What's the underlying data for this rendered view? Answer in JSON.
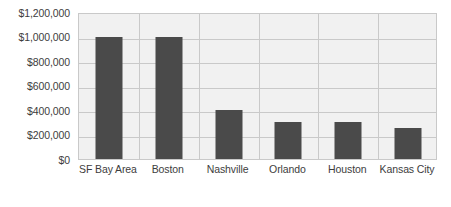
{
  "chart_data": {
    "type": "bar",
    "title": "",
    "subtitle": "",
    "xlabel": "",
    "ylabel": "",
    "categories": [
      "SF Bay Area",
      "Boston",
      "Nashville",
      "Orlando",
      "Houston",
      "Kansas City"
    ],
    "values": [
      1000000,
      1000000,
      400000,
      300000,
      300000,
      250000
    ],
    "ylim": [
      0,
      1200000
    ],
    "ytick_values": [
      0,
      200000,
      400000,
      600000,
      800000,
      1000000,
      1200000
    ],
    "ytick_labels": [
      "$0",
      "$200,000",
      "$400,000",
      "$600,000",
      "$800,000",
      "$1,000,000",
      "$1,200,000"
    ],
    "grid": "both",
    "legend": "none",
    "colors": {
      "bar": "#4a4a4a",
      "plot_background": "#f1f1f1",
      "gridline": "#c9c9c9",
      "axis_border": "#c9c9c9",
      "text": "#3d3d3d",
      "page_background": "#ffffff"
    }
  }
}
